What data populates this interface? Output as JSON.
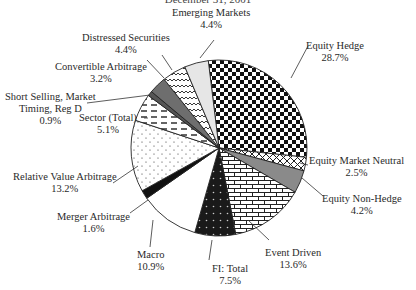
{
  "chart_data": {
    "type": "pie",
    "title": "December 31, 2001",
    "start_angle_deg": -7,
    "direction": "clockwise",
    "center": [
      219,
      148
    ],
    "radius": 88,
    "slices": [
      {
        "label": "Equity Hedge",
        "value": 28.7,
        "value_label": "28.7%",
        "pattern": "checker"
      },
      {
        "label": "Equity Market Neutral",
        "value": 2.5,
        "value_label": "2.5%",
        "pattern": "crosshatch"
      },
      {
        "label": "Equity Non-Hedge",
        "value": 4.2,
        "value_label": "4.2%",
        "pattern": "gray"
      },
      {
        "label": "Event Driven",
        "value": 13.6,
        "value_label": "13.6%",
        "pattern": "brick"
      },
      {
        "label": "FI: Total",
        "value": 7.5,
        "value_label": "7.5%",
        "pattern": "darkdots"
      },
      {
        "label": "Macro",
        "value": 10.9,
        "value_label": "10.9%",
        "pattern": "white"
      },
      {
        "label": "Merger Arbitrage",
        "value": 1.6,
        "value_label": "1.6%",
        "pattern": "black"
      },
      {
        "label": "Relative Value Arbitrage",
        "value": 13.2,
        "value_label": "13.2%",
        "pattern": "dots"
      },
      {
        "label": "Sector (Total)",
        "value": 5.1,
        "value_label": "5.1%",
        "pattern": "dashes"
      },
      {
        "label": "Short Selling, Market Timing, Reg D",
        "value": 0.9,
        "value_label": "0.9%",
        "pattern": "darkgray"
      },
      {
        "label": "Convertible Arbitrage",
        "value": 3.2,
        "value_label": "3.2%",
        "pattern": "midgray"
      },
      {
        "label": "Distressed Securities",
        "value": 4.4,
        "value_label": "4.4%",
        "pattern": "wave"
      },
      {
        "label": "Emerging Markets",
        "value": 4.4,
        "value_label": "4.4%",
        "pattern": "lightgray"
      }
    ]
  },
  "labels": {
    "emerging": {
      "name": "Emerging Markets",
      "pct": "4.4%"
    },
    "distressed": {
      "name": "Distressed Securities",
      "pct": "4.4%"
    },
    "convertible": {
      "name": "Convertible Arbitrage",
      "pct": "3.2%"
    },
    "short": {
      "line1": "Short Selling, Market",
      "line2": "Timing, Reg D",
      "pct": "0.9%"
    },
    "sector": {
      "name": "Sector (Total)",
      "pct": "5.1%"
    },
    "relval": {
      "name": "Relative Value Arbitrage",
      "pct": "13.2%"
    },
    "merger": {
      "name": "Merger Arbitrage",
      "pct": "1.6%"
    },
    "macro": {
      "name": "Macro",
      "pct": "10.9%"
    },
    "fi": {
      "name": "FI: Total",
      "pct": "7.5%"
    },
    "event": {
      "name": "Event Driven",
      "pct": "13.6%"
    },
    "nonhedge": {
      "name": "Equity Non-Hedge",
      "pct": "4.2%"
    },
    "neutral": {
      "name": "Equity Market Neutral",
      "pct": "2.5%"
    },
    "hedge": {
      "name": "Equity Hedge",
      "pct": "28.7%"
    }
  }
}
